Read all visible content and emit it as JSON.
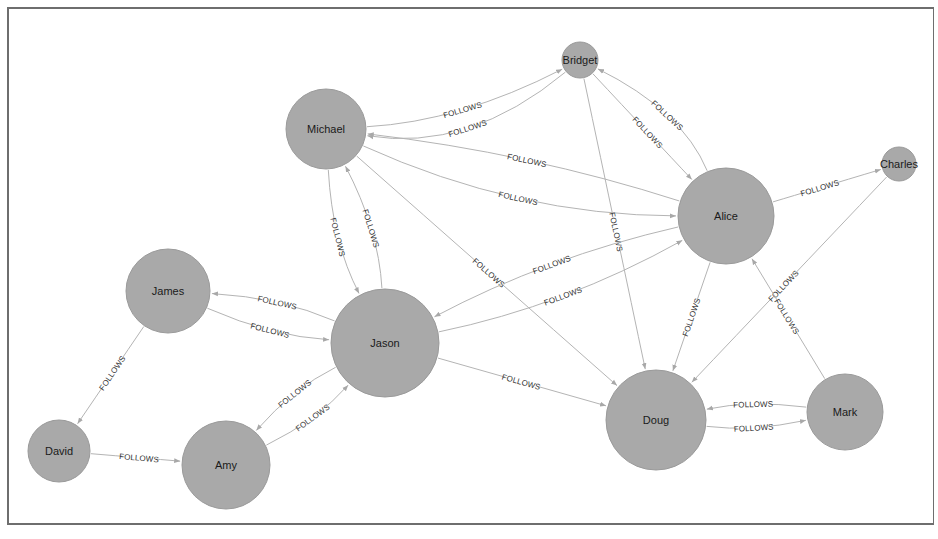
{
  "diagram": {
    "type": "graph",
    "node_fill": "#a9a9a9",
    "edge_color": "#b4b4b4",
    "relationship_label": "FOLLOWS",
    "nodes": [
      {
        "id": "Michael",
        "label": "Michael",
        "x": 326,
        "y": 129,
        "r": 40
      },
      {
        "id": "Bridget",
        "label": "Bridget",
        "x": 580,
        "y": 60,
        "r": 18
      },
      {
        "id": "Alice",
        "label": "Alice",
        "x": 726,
        "y": 216,
        "r": 48
      },
      {
        "id": "Charles",
        "label": "Charles",
        "x": 899,
        "y": 164,
        "r": 17
      },
      {
        "id": "James",
        "label": "James",
        "x": 168,
        "y": 291,
        "r": 42
      },
      {
        "id": "Jason",
        "label": "Jason",
        "x": 385,
        "y": 343,
        "r": 54
      },
      {
        "id": "David",
        "label": "David",
        "x": 59,
        "y": 451,
        "r": 31
      },
      {
        "id": "Amy",
        "label": "Amy",
        "x": 226,
        "y": 465,
        "r": 44
      },
      {
        "id": "Doug",
        "label": "Doug",
        "x": 656,
        "y": 420,
        "r": 50
      },
      {
        "id": "Mark",
        "label": "Mark",
        "x": 845,
        "y": 412,
        "r": 38
      }
    ],
    "edges": [
      {
        "from": "Bridget",
        "to": "Michael",
        "label": "FOLLOWS",
        "curve": -30
      },
      {
        "from": "Michael",
        "to": "Bridget",
        "label": "FOLLOWS",
        "curve": 14
      },
      {
        "from": "Michael",
        "to": "Alice",
        "label": "FOLLOWS",
        "curve": 22
      },
      {
        "from": "Alice",
        "to": "Michael",
        "label": "FOLLOWS",
        "curve": 10
      },
      {
        "from": "Michael",
        "to": "Jason",
        "label": "FOLLOWS",
        "curve": 12
      },
      {
        "from": "Jason",
        "to": "Michael",
        "label": "FOLLOWS",
        "curve": 12
      },
      {
        "from": "Michael",
        "to": "Doug",
        "label": "FOLLOWS",
        "curve": 0
      },
      {
        "from": "Bridget",
        "to": "Alice",
        "label": "FOLLOWS",
        "curve": 0
      },
      {
        "from": "Alice",
        "to": "Bridget",
        "label": "FOLLOWS",
        "curve": 20
      },
      {
        "from": "Bridget",
        "to": "Doug",
        "label": "FOLLOWS",
        "curve": 0
      },
      {
        "from": "Alice",
        "to": "Charles",
        "label": "FOLLOWS",
        "curve": 0
      },
      {
        "from": "Alice",
        "to": "Jason",
        "label": "FOLLOWS",
        "curve": 12
      },
      {
        "from": "Jason",
        "to": "Alice",
        "label": "FOLLOWS",
        "curve": 14
      },
      {
        "from": "Alice",
        "to": "Doug",
        "label": "FOLLOWS",
        "curve": 0
      },
      {
        "from": "Charles",
        "to": "Doug",
        "label": "FOLLOWS",
        "curve": 0
      },
      {
        "from": "Mark",
        "to": "Alice",
        "label": "FOLLOWS",
        "curve": 0
      },
      {
        "from": "Mark",
        "to": "Doug",
        "label": "FOLLOWS",
        "curve": 8
      },
      {
        "from": "Doug",
        "to": "Mark",
        "label": "FOLLOWS",
        "curve": 8
      },
      {
        "from": "Jason",
        "to": "James",
        "label": "FOLLOWS",
        "curve": 10
      },
      {
        "from": "James",
        "to": "Jason",
        "label": "FOLLOWS",
        "curve": 10
      },
      {
        "from": "Jason",
        "to": "Doug",
        "label": "FOLLOWS",
        "curve": 0
      },
      {
        "from": "James",
        "to": "David",
        "label": "FOLLOWS",
        "curve": 0
      },
      {
        "from": "David",
        "to": "Amy",
        "label": "FOLLOWS",
        "curve": 0
      },
      {
        "from": "Jason",
        "to": "Amy",
        "label": "FOLLOWS",
        "curve": 10
      },
      {
        "from": "Amy",
        "to": "Jason",
        "label": "FOLLOWS",
        "curve": 10
      }
    ]
  }
}
